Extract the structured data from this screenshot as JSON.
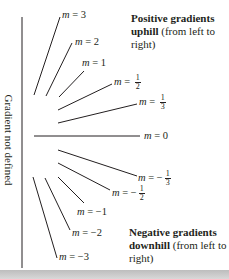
{
  "diagram": {
    "vertical_label": "Gradient not defined",
    "positive_note": {
      "bold": "Positive gradients uphill",
      "normal": " (from left to right)"
    },
    "negative_note": {
      "bold": "Negative gradients downhill",
      "normal": " (from left to right)"
    },
    "lines": [
      {
        "id": "m3",
        "var": "m",
        "eq": " = ",
        "value": "3",
        "frac": null
      },
      {
        "id": "m2",
        "var": "m",
        "eq": " = ",
        "value": "2",
        "frac": null
      },
      {
        "id": "m1",
        "var": "m",
        "eq": " = ",
        "value": "1",
        "frac": null
      },
      {
        "id": "m1_2",
        "var": "m",
        "eq": " = ",
        "value": "",
        "frac": {
          "num": "1",
          "den": "2"
        }
      },
      {
        "id": "m1_3",
        "var": "m",
        "eq": " = ",
        "value": "",
        "frac": {
          "num": "1",
          "den": "3"
        }
      },
      {
        "id": "m0",
        "var": "m",
        "eq": " = ",
        "value": "0",
        "frac": null
      },
      {
        "id": "mn1_3",
        "var": "m",
        "eq": " = ",
        "value": "−",
        "frac": {
          "num": "1",
          "den": "3"
        }
      },
      {
        "id": "mn1_2",
        "var": "m",
        "eq": " = ",
        "value": "−",
        "frac": {
          "num": "1",
          "den": "2"
        }
      },
      {
        "id": "mn1",
        "var": "m",
        "eq": " = ",
        "value": "−1",
        "frac": null
      },
      {
        "id": "mn2",
        "var": "m",
        "eq": " = ",
        "value": "−2",
        "frac": null
      },
      {
        "id": "mn3",
        "var": "m",
        "eq": " = ",
        "value": "−3",
        "frac": null
      }
    ],
    "colors": {
      "line": "#231f20",
      "background": "#ffffff",
      "bottom_bar": "#c8c8c8"
    }
  }
}
